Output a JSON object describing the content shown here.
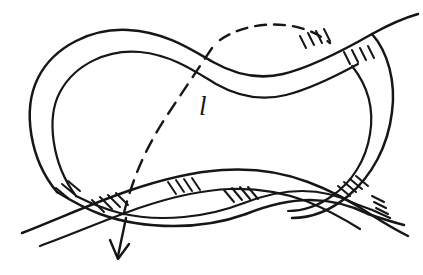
{
  "figure": {
    "kind": "hand-drawn-knot-diagram",
    "background_color": "#ffffff",
    "ink_color": "#161616",
    "width": 423,
    "height": 275
  },
  "labels": [
    {
      "id": "loop-label",
      "text": "l",
      "style": "italic",
      "x": 199,
      "y": 93,
      "meaning": "core-curve-label"
    }
  ],
  "annotations": {
    "hidden_arc": {
      "name": "dashed-hidden-arc",
      "line_style": "dashed",
      "description": "dashed curve passing behind the band from the upper right, across the interior, exiting at the lower left"
    },
    "orientation_arrow": {
      "name": "direction-arrow",
      "direction": "down-left",
      "tip_x": 118,
      "tip_y": 258,
      "description": "arrowhead at the lower end of the dashed arc indicating orientation"
    },
    "crossings": [
      {
        "id": "crossing-upper-right",
        "x": 330,
        "y": 48,
        "under_strand": "band-edge",
        "hatching": true
      },
      {
        "id": "crossing-lower-left",
        "x": 92,
        "y": 206,
        "under_strand": "band-edge",
        "hatching": true
      },
      {
        "id": "crossing-lower-mid",
        "x": 200,
        "y": 190,
        "under_strand": "band-edge",
        "hatching": true
      },
      {
        "id": "crossing-lower-right",
        "x": 300,
        "y": 200,
        "under_strand": "band-edge",
        "hatching": true
      }
    ],
    "hatch_marks_meaning": "short parallel tick strokes marking the cut/under side of the band at each crossing"
  }
}
